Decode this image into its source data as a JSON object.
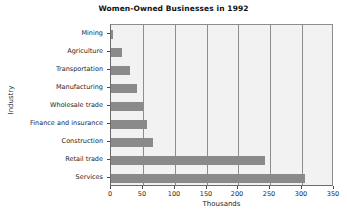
{
  "chart_data": {
    "type": "bar",
    "orientation": "horizontal",
    "title": "Women-Owned Businesses in 1992",
    "xlabel": "Thousands",
    "ylabel": "Industry",
    "categories": [
      "Mining",
      "Agriculture",
      "Transportation",
      "Manufacturing",
      "Wholesale trade",
      "Finance and insurance",
      "Construction",
      "Retail trade",
      "Services"
    ],
    "values": [
      3,
      17,
      30,
      41,
      50,
      57,
      66,
      242,
      305
    ],
    "xlim": [
      0,
      350
    ],
    "xticks": [
      0,
      50,
      100,
      150,
      200,
      250,
      300,
      350
    ],
    "xtick_labels": [
      "0",
      "50",
      "100",
      "150",
      "200",
      "250",
      "300",
      "350"
    ],
    "grid": "vertical",
    "legend": "none",
    "bar_color": "#8a8a8a",
    "plot_background": "#f2f2f2",
    "axis_color": "#6b6b6b",
    "gridline_color": "#8d8d8d"
  }
}
